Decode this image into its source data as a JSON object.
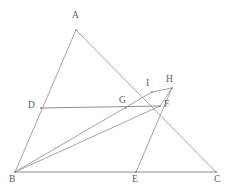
{
  "figure": {
    "width": 232,
    "height": 194,
    "background_color": "#ffffff",
    "line_color": "#8a8a8a"
  },
  "labels": {
    "A": "A",
    "B": "B",
    "C": "C",
    "D": "D",
    "E": "E",
    "F": "F",
    "G": "G",
    "H": "H",
    "I": "I"
  },
  "points": [
    {
      "id": "A",
      "label": "A",
      "x": 76,
      "y": 30,
      "label_x": 72,
      "label_y": 11
    },
    {
      "id": "B",
      "label": "B",
      "x": 15,
      "y": 172,
      "label_x": 9,
      "label_y": 175
    },
    {
      "id": "C",
      "label": "C",
      "x": 216,
      "y": 172,
      "label_x": 214,
      "label_y": 175
    },
    {
      "id": "D",
      "label": "D",
      "x": 41,
      "y": 108,
      "label_x": 28,
      "label_y": 101
    },
    {
      "id": "E",
      "label": "E",
      "x": 136,
      "y": 172,
      "label_x": 132,
      "label_y": 175
    },
    {
      "id": "F",
      "label": "F",
      "x": 160,
      "y": 106,
      "label_x": 164,
      "label_y": 100
    },
    {
      "id": "G",
      "label": "G",
      "x": 126,
      "y": 108,
      "label_x": 119,
      "label_y": 96
    },
    {
      "id": "H",
      "label": "H",
      "x": 172,
      "y": 88,
      "label_x": 166,
      "label_y": 75
    },
    {
      "id": "I",
      "label": "I",
      "x": 152,
      "y": 92,
      "label_x": 146,
      "label_y": 79
    }
  ],
  "segments": [
    {
      "id": "AB",
      "from": "A",
      "to": "B",
      "style": "thin"
    },
    {
      "id": "AC",
      "from": "A",
      "to": "C",
      "style": "thin"
    },
    {
      "id": "BC",
      "from": "B",
      "to": "C",
      "style": "base"
    },
    {
      "id": "DF",
      "from": "D",
      "to": "F",
      "style": "base"
    },
    {
      "id": "BF",
      "from": "B",
      "to": "F",
      "style": "thin"
    },
    {
      "id": "EH",
      "from": "E",
      "to": "H",
      "style": "thin"
    },
    {
      "id": "IH",
      "from": "I",
      "to": "H",
      "style": "thin"
    },
    {
      "id": "HF",
      "from": "H",
      "to": "F",
      "style": "thin"
    },
    {
      "id": "BI",
      "from": "B",
      "to": "I",
      "style": "thin"
    }
  ]
}
